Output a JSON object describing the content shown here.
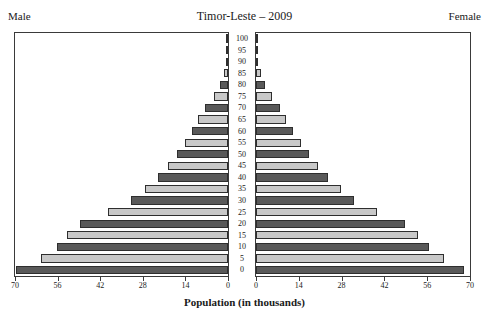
{
  "header": {
    "male_label": "Male",
    "female_label": "Female",
    "title": "Timor-Leste – 2009"
  },
  "axis": {
    "x_title": "Population (in thousands)",
    "x_ticks_male": [
      70,
      56,
      42,
      28,
      14,
      0
    ],
    "x_ticks_female": [
      0,
      14,
      28,
      42,
      56,
      70
    ],
    "age_ticks": [
      100,
      95,
      90,
      85,
      80,
      75,
      70,
      65,
      60,
      55,
      50,
      45,
      40,
      35,
      30,
      25,
      20,
      15,
      10,
      5,
      0
    ]
  },
  "colors": {
    "bar_dark": "#595959",
    "bar_light": "#c8c8c8",
    "bar_border": "#2e2e2e",
    "panel_border": "#3a3a3a",
    "background": "#ffffff",
    "text": "#1a1a1a"
  },
  "chart_data": {
    "type": "bar",
    "title": "Timor-Leste – 2009",
    "subtitle": "",
    "xlabel": "Population (in thousands)",
    "ylabel": "Age group",
    "xlim": [
      0,
      70
    ],
    "grid": false,
    "legend_position": "top-corners",
    "categories": [
      "100+",
      "95-99",
      "90-94",
      "85-89",
      "80-84",
      "75-79",
      "70-74",
      "65-69",
      "60-64",
      "55-59",
      "50-54",
      "45-49",
      "40-44",
      "35-39",
      "30-34",
      "25-29",
      "20-24",
      "15-19",
      "10-14",
      "5-9",
      "0-4"
    ],
    "series": [
      {
        "name": "Male",
        "direction": "left",
        "values": [
          0.1,
          0.2,
          0.6,
          1.4,
          2.6,
          4.6,
          7.4,
          9.7,
          11.8,
          14.3,
          16.8,
          19.8,
          22.9,
          27.3,
          31.8,
          39.4,
          48.6,
          52.8,
          56.3,
          61.3,
          69.8
        ]
      },
      {
        "name": "Female",
        "direction": "right",
        "values": [
          0.1,
          0.3,
          0.8,
          1.5,
          2.8,
          5.1,
          7.7,
          9.9,
          12.2,
          14.7,
          17.3,
          20.2,
          23.5,
          27.9,
          32.2,
          39.7,
          48.8,
          53.1,
          56.6,
          61.6,
          68.2
        ]
      }
    ]
  }
}
